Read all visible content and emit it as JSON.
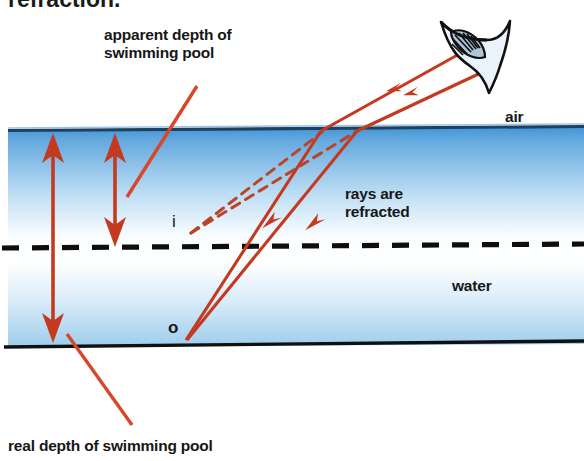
{
  "figure": {
    "domain_type": "physics-optics-diagram",
    "clipped_heading": "refraction.",
    "labels": {
      "apparent_depth": "apparent depth of\nswimming pool",
      "real_depth": "real depth of swimming pool",
      "air": "air",
      "water": "water",
      "rays_refracted": "rays are\nrefracted",
      "image_point": "i",
      "object_point": "o"
    },
    "colors": {
      "ray": "#C43A21",
      "ray_light": "#D4542E",
      "leader": "#D9472A",
      "water_top": "#4E9BD8",
      "water_mid": "#FAFDFF",
      "water_low": "#BBDCF2",
      "surface_line": "#1A3A5C",
      "floor_line": "#111111",
      "text": "#171717",
      "dash": "#111111",
      "eye_fill": "#EAF2FA",
      "iris": "#5E7F9E"
    },
    "geometry": {
      "surface_y": 130,
      "floor_y": 344,
      "dashed_level_y": 247,
      "pool_left": 8,
      "pool_right": 584,
      "object_x": 186,
      "object_y": 339,
      "image_x": 190,
      "image_y": 230
    },
    "arrows": {
      "real_depth_arrow": {
        "x": 53,
        "y_top": 133,
        "y_bottom": 341,
        "double_headed": true
      },
      "apparent_depth_arrow": {
        "x": 115,
        "y_top": 133,
        "y_bottom": 245,
        "double_headed": true
      }
    },
    "rays": [
      {
        "name": "ray-left",
        "from": [
          186,
          339
        ],
        "bend": [
          320,
          133
        ],
        "to": [
          470,
          48
        ]
      },
      {
        "name": "ray-right",
        "from": [
          186,
          339
        ],
        "bend": [
          356,
          133
        ],
        "to": [
          487,
          68
        ]
      }
    ],
    "virtual_rays": [
      {
        "name": "virtual-ray-left",
        "from": [
          190,
          232
        ],
        "to": [
          320,
          133
        ]
      },
      {
        "name": "virtual-ray-right",
        "from": [
          190,
          232
        ],
        "to": [
          356,
          133
        ]
      }
    ],
    "leaders": [
      {
        "name": "apparent-depth-leader",
        "from": [
          128,
          196
        ],
        "to": [
          196,
          87
        ]
      },
      {
        "name": "real-depth-leader",
        "from": [
          68,
          335
        ],
        "to": [
          131,
          424
        ]
      }
    ],
    "eye": {
      "cx": 487,
      "cy": 40,
      "label": "observer-eye"
    }
  }
}
